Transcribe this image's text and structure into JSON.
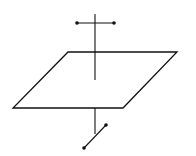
{
  "diagram": {
    "title": "",
    "stroke_color": "#111111",
    "background": "#ffffff",
    "plane": {
      "points": "68,52 177,52 123,108 13,108"
    },
    "upper_axis": {
      "x1": 95,
      "y1": 14,
      "x2": 95,
      "y2": 80
    },
    "upper_crossbar": {
      "x1": 77,
      "y1": 23,
      "x2": 114,
      "y2": 23
    },
    "lower_axis": {
      "x1": 95,
      "y1": 108,
      "x2": 95,
      "y2": 134
    },
    "lower_segment": {
      "x1": 84,
      "y1": 148,
      "x2": 106,
      "y2": 125
    }
  }
}
